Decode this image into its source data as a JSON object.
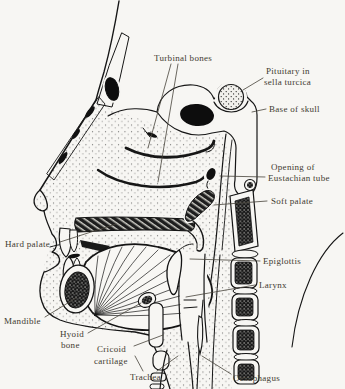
{
  "diagram": {
    "labels": {
      "turbinal_bones": "Turbinal bones",
      "pituitary_line1": "Pituitary in",
      "pituitary_line2": "sella turcica",
      "base_of_skull": "Base of skull",
      "eustachian_line1": "Opening of",
      "eustachian_line2": "Eustachian tube",
      "soft_palate": "Soft palate",
      "hard_palate": "Hard palate",
      "epiglottis": "Epiglottis",
      "larynx": "Larynx",
      "mandible": "Mandible",
      "hyoid_line1": "Hyoid",
      "hyoid_line2": "bone",
      "cricoid_line1": "Cricoid",
      "cricoid_line2": "cartilage",
      "trachea": "Trachea",
      "oesophagus": "Oesophagus"
    },
    "colors": {
      "page": "#f7f6f3",
      "ink": "#161616",
      "label_text": "#3f3b31"
    }
  }
}
